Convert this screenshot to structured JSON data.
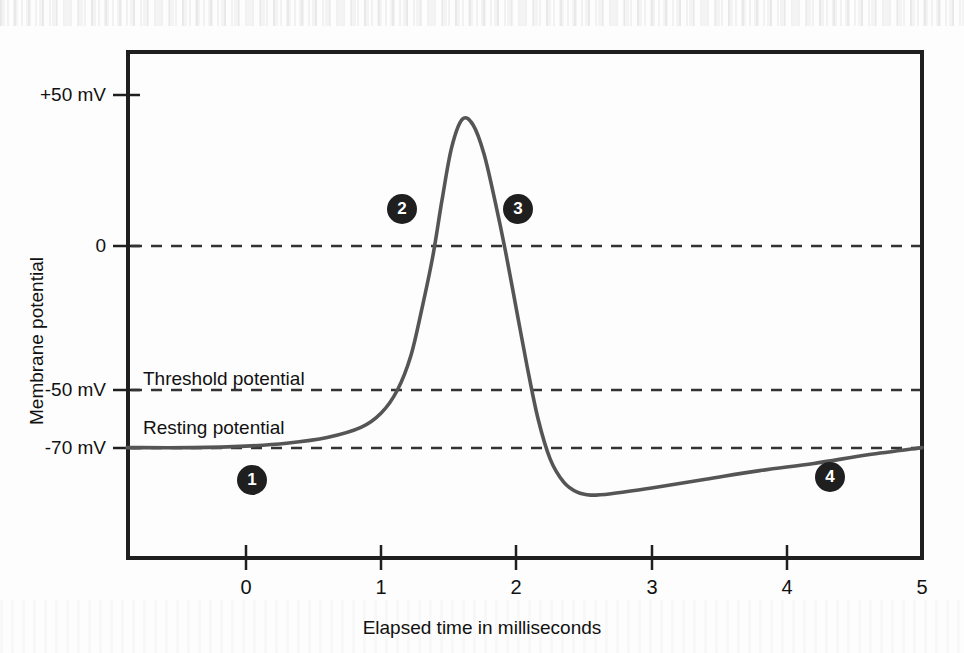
{
  "chart_data": {
    "type": "line",
    "title": "",
    "subtitle": "",
    "xlabel": "Elapsed time in milliseconds",
    "ylabel": "Membrane potential",
    "xlim": [
      -0.88,
      5.0
    ],
    "ylim": [
      -95,
      62
    ],
    "grid": false,
    "legend_position": "none",
    "x_ticks": [
      "0",
      "1",
      "2",
      "3",
      "4",
      "5"
    ],
    "x_tick_values": [
      0,
      1,
      2,
      3,
      4,
      5
    ],
    "y_ticks": [
      "+50 mV",
      "0",
      "-50 mV",
      "-70 mV"
    ],
    "y_tick_values": [
      50,
      0,
      -50,
      -70
    ],
    "reference_lines": [
      {
        "name": "zero-line",
        "label": "",
        "value": 0,
        "style": "dashed"
      },
      {
        "name": "threshold-line",
        "label": "Threshold potential",
        "value": -50,
        "style": "dashed"
      },
      {
        "name": "resting-line",
        "label": "Resting potential",
        "value": -70,
        "style": "dashed"
      }
    ],
    "series": [
      {
        "name": "Action potential",
        "color": "#555555",
        "x": [
          -0.88,
          -0.4,
          0.0,
          0.3,
          0.6,
          0.85,
          1.0,
          1.12,
          1.22,
          1.3,
          1.38,
          1.45,
          1.52,
          1.6,
          1.68,
          1.76,
          1.84,
          1.92,
          2.0,
          2.08,
          2.16,
          2.25,
          2.35,
          2.45,
          2.55,
          2.7,
          3.0,
          3.4,
          3.8,
          4.2,
          4.6,
          5.0
        ],
        "y": [
          -70,
          -70,
          -69.5,
          -68.5,
          -66.5,
          -63,
          -58,
          -50,
          -38,
          -22,
          -4,
          16,
          34,
          44,
          42,
          32,
          16,
          -2,
          -22,
          -42,
          -60,
          -74,
          -82,
          -85.5,
          -86.5,
          -86,
          -84,
          -81,
          -78,
          -75.5,
          -72.5,
          -70
        ]
      }
    ],
    "annotations": [
      {
        "name": "marker-1",
        "label": "1",
        "x": 0.05,
        "y": -83,
        "note": "resting state"
      },
      {
        "name": "marker-2",
        "label": "2",
        "x": 1.15,
        "y": 12,
        "note": "depolarization"
      },
      {
        "name": "marker-3",
        "label": "3",
        "x": 2.02,
        "y": 12,
        "note": "repolarization"
      },
      {
        "name": "marker-4",
        "label": "4",
        "x": 4.35,
        "y": -80,
        "note": "hyperpolarization / refractory"
      }
    ]
  },
  "axes": {
    "y_tick_labels": [
      "+50 mV",
      "0",
      "-50 mV",
      "-70 mV"
    ],
    "x_tick_labels": [
      "0",
      "1",
      "2",
      "3",
      "4",
      "5"
    ],
    "x_axis_title": "Elapsed time in milliseconds",
    "y_axis_title": "Membrane potential"
  },
  "labels": {
    "threshold": "Threshold potential",
    "resting": "Resting potential"
  },
  "markers": {
    "one": "1",
    "two": "2",
    "three": "3",
    "four": "4"
  },
  "colors": {
    "curve": "#555555",
    "frame": "#1f1f1f",
    "dash": "#333333",
    "marker_fill": "#1f1f1f",
    "marker_text": "#ffffff",
    "background": "#fdfdfd"
  }
}
